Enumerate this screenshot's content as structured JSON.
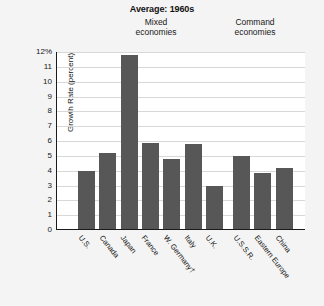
{
  "chart_data": {
    "type": "bar",
    "title": "Average: 1960s",
    "xlabel": "",
    "ylabel": "Growth Rate (percent)",
    "ylim": [
      0,
      12
    ],
    "ytick_labels": [
      "12%",
      "11",
      "10",
      "9",
      "8",
      "7",
      "6",
      "5",
      "4",
      "3",
      "2",
      "1",
      "0"
    ],
    "ytick_values": [
      12,
      11,
      10,
      9,
      8,
      7,
      6,
      5,
      4,
      3,
      2,
      1,
      0
    ],
    "grid": true,
    "legend": "none",
    "groups": [
      {
        "name": "Mixed economies",
        "line1": "Mixed",
        "line2": "economies"
      },
      {
        "name": "Command economies",
        "line1": "Command",
        "line2": "economies"
      }
    ],
    "categories": [
      "U.S.",
      "Canada",
      "Japan",
      "France",
      "W. Germany†",
      "Italy",
      "U.K.",
      "U.S.S.R.",
      "Eastern Europe",
      "China"
    ],
    "values": [
      3.9,
      5.1,
      11.7,
      5.8,
      4.7,
      5.7,
      2.9,
      4.9,
      3.8,
      4.1
    ],
    "points": [
      {
        "label": "U.S.",
        "value": 3.9,
        "group": "Mixed economies"
      },
      {
        "label": "Canada",
        "value": 5.1,
        "group": "Mixed economies"
      },
      {
        "label": "Japan",
        "value": 11.7,
        "group": "Mixed economies"
      },
      {
        "label": "France",
        "value": 5.8,
        "group": "Mixed economies"
      },
      {
        "label": "W. Germany†",
        "value": 4.7,
        "group": "Mixed economies"
      },
      {
        "label": "Italy",
        "value": 5.7,
        "group": "Mixed economies"
      },
      {
        "label": "U.K.",
        "value": 2.9,
        "group": "Mixed economies"
      },
      {
        "label": "U.S.S.R.",
        "value": 4.9,
        "group": "Command economies"
      },
      {
        "label": "Eastern Europe",
        "value": 3.8,
        "group": "Command economies"
      },
      {
        "label": "China",
        "value": 4.1,
        "group": "Command economies"
      }
    ],
    "colors": {
      "bar": "#575757",
      "axis": "#1b1b1b",
      "grid": "#d8d8d8",
      "plot_background": "#ffffff",
      "page_background": "#f4f4f4",
      "text": "#141414"
    }
  }
}
